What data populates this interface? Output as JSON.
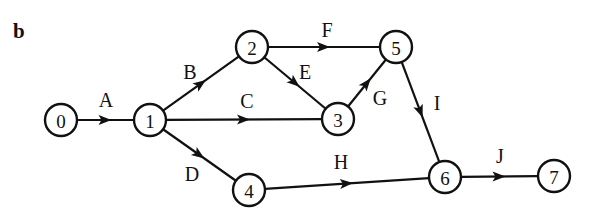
{
  "panel_label": "b",
  "colors": {
    "stroke": "#111111",
    "background": "#ffffff"
  },
  "nodes": [
    {
      "id": "0",
      "label": "0",
      "x": 61,
      "y": 120
    },
    {
      "id": "1",
      "label": "1",
      "x": 150,
      "y": 120
    },
    {
      "id": "2",
      "label": "2",
      "x": 252,
      "y": 47
    },
    {
      "id": "3",
      "label": "3",
      "x": 338,
      "y": 119
    },
    {
      "id": "4",
      "label": "4",
      "x": 249,
      "y": 190
    },
    {
      "id": "5",
      "label": "5",
      "x": 396,
      "y": 47
    },
    {
      "id": "6",
      "label": "6",
      "x": 445,
      "y": 177
    },
    {
      "id": "7",
      "label": "7",
      "x": 554,
      "y": 176
    }
  ],
  "edges": [
    {
      "label": "A",
      "from": "0",
      "to": "1",
      "lx": 106,
      "ly": 107
    },
    {
      "label": "B",
      "from": "1",
      "to": "2",
      "lx": 190,
      "ly": 79
    },
    {
      "label": "C",
      "from": "1",
      "to": "3",
      "lx": 247,
      "ly": 108
    },
    {
      "label": "D",
      "from": "1",
      "to": "4",
      "lx": 192,
      "ly": 181
    },
    {
      "label": "E",
      "from": "2",
      "to": "3",
      "lx": 305,
      "ly": 79
    },
    {
      "label": "F",
      "from": "2",
      "to": "5",
      "lx": 327,
      "ly": 37
    },
    {
      "label": "G",
      "from": "3",
      "to": "5",
      "lx": 380,
      "ly": 105
    },
    {
      "label": "H",
      "from": "4",
      "to": "6",
      "lx": 341,
      "ly": 169
    },
    {
      "label": "I",
      "from": "5",
      "to": "6",
      "lx": 437,
      "ly": 110
    },
    {
      "label": "J",
      "from": "6",
      "to": "7",
      "lx": 500,
      "ly": 163
    }
  ]
}
